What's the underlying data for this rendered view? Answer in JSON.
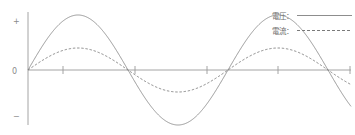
{
  "chart_data": {
    "type": "line",
    "title": "",
    "xlabel": "",
    "ylabel": "",
    "grid": false,
    "legend_position": "top-right",
    "x_axis": {
      "min": 0,
      "max": 360,
      "zero_line": true,
      "tick_positions_px": [
        63,
        135,
        207,
        278,
        350
      ],
      "tick_labels": [
        "",
        "",
        "",
        "",
        ""
      ],
      "axis_start_px": 28,
      "axis_end_px": 351,
      "baseline_y_px": 70
    },
    "y_axis": {
      "labels": [
        "+",
        "0",
        "−"
      ],
      "plus_label": "+",
      "zero_label": "0",
      "minus_label": "−",
      "ylim": [
        -1.15,
        1.15
      ],
      "axis_x_px": 28,
      "axis_top_px": 12,
      "axis_bottom_px": 125
    },
    "series": [
      {
        "name": "電圧",
        "style": "solid",
        "color": "#8d8d8d",
        "amplitude": 1.0,
        "period_px": 200,
        "phase_deg": 0,
        "peak_y_px": 15,
        "trough_y_px": 122,
        "x_start_px": 28,
        "x_end_px": 351
      },
      {
        "name": "電流",
        "style": "dashed",
        "color": "#7a7a7a",
        "amplitude": 0.4,
        "period_px": 200,
        "phase_deg": 0,
        "peak_y_px": 48,
        "trough_y_px": 92,
        "x_start_px": 28,
        "x_end_px": 351
      }
    ]
  },
  "legend": {
    "items": [
      {
        "label": "電圧：",
        "style": "solid"
      },
      {
        "label": "電流：",
        "style": "dashed"
      }
    ]
  },
  "axis": {
    "plus": "+",
    "zero": "0",
    "minus": "−"
  },
  "colors": {
    "background": "#ffffff",
    "axis": "#9a9a9a",
    "voltage": "#8d8d8d",
    "current": "#7a7a7a",
    "text": "#8a8a8a"
  }
}
